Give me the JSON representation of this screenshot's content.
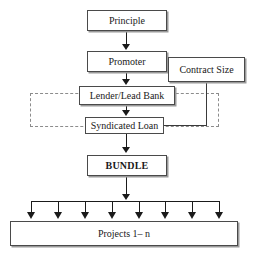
{
  "diagram": {
    "nodes": {
      "principle": "Principle",
      "promoter": "Promoter",
      "contract_size": "Contract Size",
      "lender": "Lender/Lead Bank",
      "syndicated_loan": "Syndicated Loan",
      "bundle": "BUNDLE",
      "projects": "Projects 1– n"
    },
    "colors": {
      "box_border": "#4a4a4a",
      "box_fill": "#ffffff",
      "dashed_border": "#8c8c8c",
      "connector": "#1a1a1a",
      "text": "#1a1a1a",
      "background": "#ffffff"
    },
    "fan_out": {
      "branch_count": 8,
      "branch_x": [
        31,
        58,
        85,
        112,
        139,
        165,
        192,
        219
      ]
    },
    "enclosure": {
      "style": "dashed",
      "encloses": [
        "Lender/Lead Bank",
        "Syndicated Loan"
      ]
    },
    "edges": [
      {
        "from": "Principle",
        "to": "Promoter",
        "style": "solid-arrow"
      },
      {
        "from": "Promoter",
        "to": "Lender/Lead Bank",
        "style": "solid-arrow"
      },
      {
        "from": "Lender/Lead Bank",
        "to": "Syndicated Loan",
        "style": "solid-arrow"
      },
      {
        "from": "Contract Size",
        "to": "Syndicated Loan",
        "style": "solid-line"
      },
      {
        "from": "Syndicated Loan",
        "to": "BUNDLE",
        "style": "solid-arrow"
      },
      {
        "from": "BUNDLE",
        "to": "Projects 1– n",
        "style": "fan-out-arrows"
      }
    ]
  }
}
